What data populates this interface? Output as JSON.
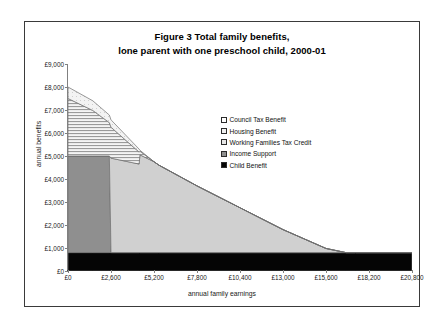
{
  "figure": {
    "title_line1": "Figure 3   Total family benefits,",
    "title_line2": "lone parent with one preschool child, 2000-01"
  },
  "chart_data": {
    "type": "area",
    "stacked": true,
    "title": "Figure 3   Total family benefits, lone parent with one preschool child, 2000-01",
    "xlabel": "annual family earnings",
    "ylabel": "annual benefits",
    "xlim": [
      0,
      20800
    ],
    "ylim": [
      0,
      9000
    ],
    "grid": false,
    "legend_position": "inside-right",
    "x_ticks": [
      0,
      2600,
      5200,
      7800,
      10400,
      13000,
      15600,
      18200,
      20800
    ],
    "x_tick_labels": [
      "£0",
      "£2,600",
      "£5,200",
      "£7,800",
      "£10,400",
      "£13,000",
      "£15,600",
      "£18,200",
      "£20,800"
    ],
    "y_ticks": [
      0,
      1000,
      2000,
      3000,
      4000,
      5000,
      6000,
      7000,
      8000,
      9000
    ],
    "y_tick_labels": [
      "£0",
      "£1,000",
      "£2,000",
      "£3,000",
      "£4,000",
      "£5,000",
      "£6,000",
      "£7,000",
      "£8,000",
      "£9,000"
    ],
    "x": [
      0,
      1500,
      2500,
      2600,
      2650,
      4300,
      4350,
      5200,
      5500,
      7800,
      10400,
      13000,
      15600,
      16800,
      17400,
      20800
    ],
    "series": [
      {
        "name": "Child Benefit",
        "color": "#050505",
        "pattern": "solid",
        "values": [
          800,
          800,
          800,
          800,
          800,
          800,
          800,
          800,
          800,
          800,
          800,
          800,
          800,
          800,
          800,
          800
        ]
      },
      {
        "name": "Income Support",
        "color": "#8f8f8f",
        "pattern": "solid",
        "values": [
          4200,
          4200,
          4200,
          0,
          0,
          0,
          0,
          0,
          0,
          0,
          0,
          0,
          0,
          0,
          0,
          0
        ]
      },
      {
        "name": "Working Families Tax Credit",
        "color": "#d0d0d0",
        "pattern": "solid",
        "values": [
          0,
          0,
          0,
          4100,
          4100,
          3850,
          4250,
          3950,
          3800,
          2900,
          1950,
          1000,
          180,
          0,
          0,
          0
        ]
      },
      {
        "name": "Housing Benefit",
        "color": "#e8e8e8",
        "pattern": "horizontal-hatch",
        "values": [
          2500,
          1980,
          1450,
          1350,
          1320,
          520,
          160,
          0,
          0,
          0,
          0,
          0,
          0,
          0,
          0,
          0
        ]
      },
      {
        "name": "Council Tax Benefit",
        "color": "#efefef",
        "pattern": "light",
        "values": [
          500,
          420,
          330,
          320,
          315,
          130,
          40,
          0,
          0,
          0,
          0,
          0,
          0,
          0,
          0,
          0
        ]
      }
    ]
  },
  "legend": {
    "items": [
      {
        "label": "Council Tax Benefit",
        "swatch": "council"
      },
      {
        "label": "Housing Benefit",
        "swatch": "housing"
      },
      {
        "label": "Working Families Tax Credit",
        "swatch": "wftc"
      },
      {
        "label": "Income Support",
        "swatch": "income"
      },
      {
        "label": "Child Benefit",
        "swatch": "child"
      }
    ]
  }
}
